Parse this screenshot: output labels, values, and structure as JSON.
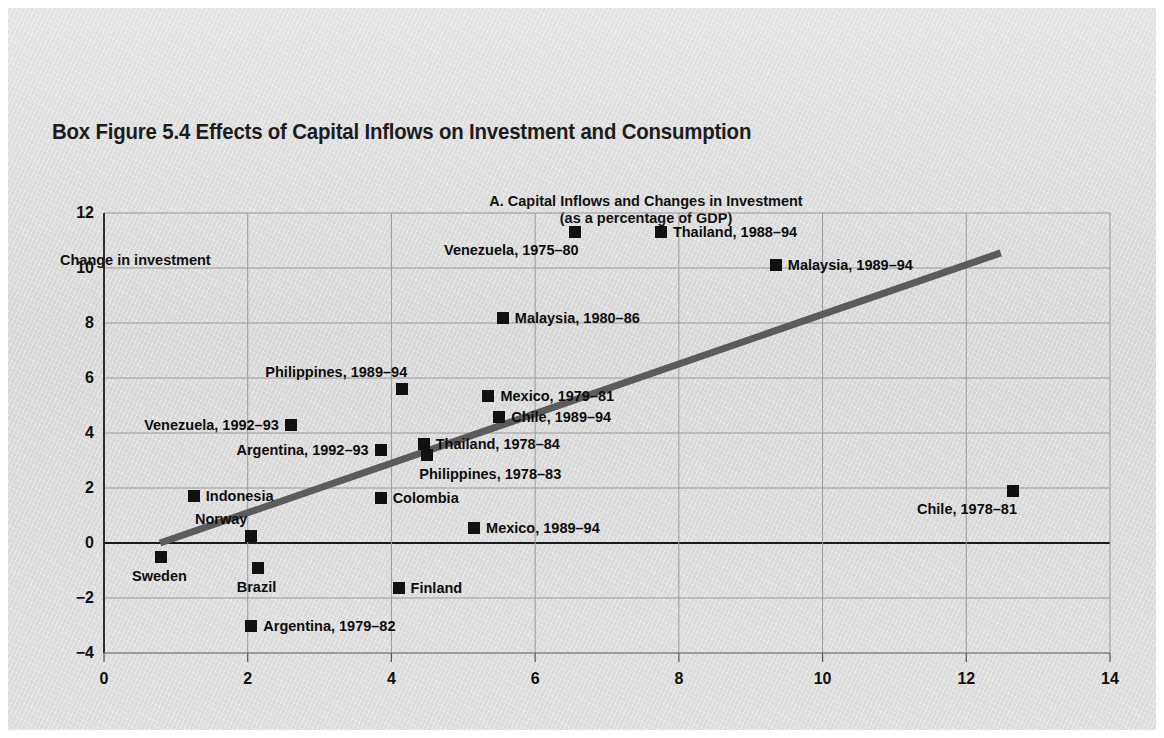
{
  "figure": {
    "title": "Box Figure 5.4  Effects of Capital Inflows on Investment and Consumption",
    "panel_title_line1": "A. Capital Inflows and Changes in Investment",
    "panel_title_line2": "(as a percentage of GDP)"
  },
  "chart_data": {
    "type": "scatter",
    "title": "A. Capital Inflows and Changes in Investment (as a percentage of GDP)",
    "xlabel": "Private capital inflows",
    "ylabel": "Change in investment",
    "xlim": [
      0,
      14
    ],
    "ylim": [
      -4,
      12
    ],
    "xticks": [
      "0",
      "2",
      "4",
      "6",
      "8",
      "10",
      "12",
      "14"
    ],
    "yticks": [
      "12",
      "10",
      "8",
      "6",
      "4",
      "2",
      "0",
      "−2",
      "−4"
    ],
    "grid": true,
    "legend": "none",
    "marker_color": "#111111",
    "trendline": {
      "color": "#5b5b5b",
      "x": [
        0.78,
        12.48
      ],
      "y": [
        0.0,
        10.55
      ]
    },
    "points": [
      {
        "label": "Thailand, 1988–94",
        "x": 7.75,
        "y": 11.3,
        "label_pos": "right"
      },
      {
        "label": "Venezuela, 1975–80",
        "x": 6.55,
        "y": 11.3,
        "label_pos": "below-left"
      },
      {
        "label": "Malaysia, 1989–94",
        "x": 9.35,
        "y": 10.1,
        "label_pos": "right"
      },
      {
        "label": "Malaysia, 1980–86",
        "x": 5.55,
        "y": 8.2,
        "label_pos": "right"
      },
      {
        "label": "Philippines, 1989–94",
        "x": 4.15,
        "y": 5.6,
        "label_pos": "above-left"
      },
      {
        "label": "Mexico, 1979–81",
        "x": 5.35,
        "y": 5.35,
        "label_pos": "right"
      },
      {
        "label": "Chile, 1989–94",
        "x": 5.5,
        "y": 4.6,
        "label_pos": "right"
      },
      {
        "label": "Venezuela, 1992–93",
        "x": 2.6,
        "y": 4.3,
        "label_pos": "left"
      },
      {
        "label": "Argentina, 1992–93",
        "x": 3.85,
        "y": 3.4,
        "label_pos": "left"
      },
      {
        "label": "Thailand, 1978–84",
        "x": 4.45,
        "y": 3.6,
        "label_pos": "right"
      },
      {
        "label": "Philippines, 1978–83",
        "x": 4.5,
        "y": 3.2,
        "label_pos": "below-right"
      },
      {
        "label": "Indonesia",
        "x": 1.25,
        "y": 1.7,
        "label_pos": "right"
      },
      {
        "label": "Colombia",
        "x": 3.85,
        "y": 1.65,
        "label_pos": "right"
      },
      {
        "label": "Chile, 1978–81",
        "x": 12.65,
        "y": 1.9,
        "label_pos": "below-left"
      },
      {
        "label": "Norway",
        "x": 2.05,
        "y": 0.25,
        "label_pos": "above"
      },
      {
        "label": "Mexico, 1989–94",
        "x": 5.15,
        "y": 0.55,
        "label_pos": "right"
      },
      {
        "label": "Sweden",
        "x": 0.8,
        "y": -0.5,
        "label_pos": "below"
      },
      {
        "label": "Brazil",
        "x": 2.15,
        "y": -0.9,
        "label_pos": "below"
      },
      {
        "label": "Finland",
        "x": 4.1,
        "y": -1.65,
        "label_pos": "right"
      },
      {
        "label": "Argentina, 1979–82",
        "x": 2.05,
        "y": -3.0,
        "label_pos": "right"
      }
    ]
  }
}
